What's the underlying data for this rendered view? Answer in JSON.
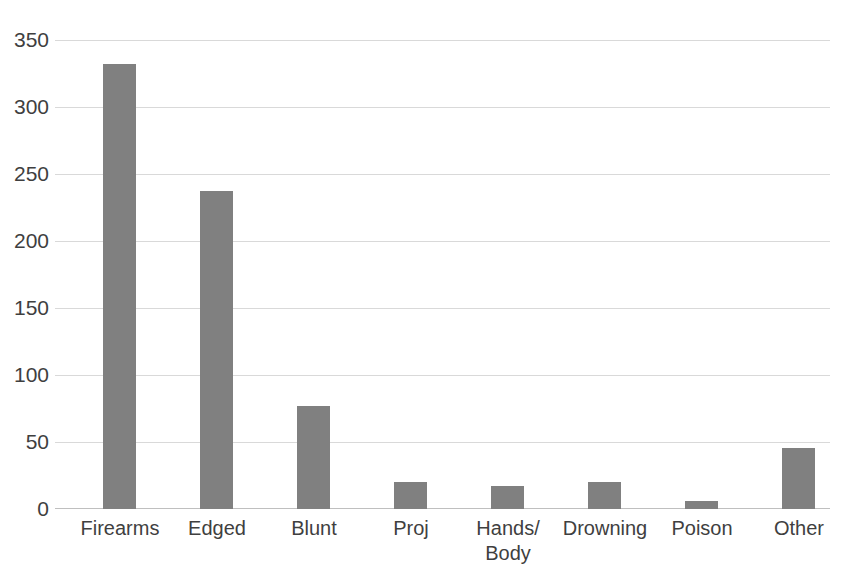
{
  "chart_data": {
    "type": "bar",
    "title": "",
    "subtitle": "",
    "xlabel": "",
    "ylabel": "",
    "categories": [
      "Firearms",
      "Edged",
      "Blunt",
      "Proj",
      "Hands/\nBody",
      "Drowning",
      "Poison",
      "Other"
    ],
    "values": [
      333,
      238,
      77,
      20,
      17,
      20,
      6,
      46
    ],
    "series": [
      {
        "name": "Count",
        "values": [
          333,
          238,
          77,
          20,
          17,
          20,
          6,
          46
        ]
      }
    ],
    "ylim": [
      0,
      350
    ],
    "yticks": [
      0,
      50,
      100,
      150,
      200,
      250,
      300,
      350
    ],
    "ytick_labels": [
      "0",
      "50",
      "100",
      "150",
      "200",
      "250",
      "300",
      "350"
    ],
    "grid": "horizontal",
    "legend": "none",
    "bar_color": "#808080",
    "gridline_color": "#d9d9d9",
    "axis_color": "#bfbfbf",
    "text_color": "#3f3f3f",
    "background": "#ffffff"
  }
}
